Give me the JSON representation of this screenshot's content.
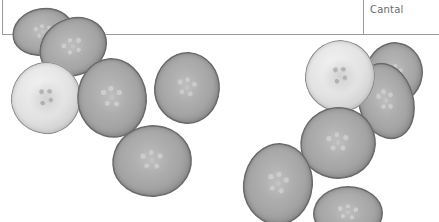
{
  "table_fragment": {
    "cell_text": "Cantal",
    "border_color": "#9a9a9a"
  },
  "photo": {
    "subject": "cucumber slices",
    "tone": "grayscale",
    "slice_count": 12,
    "slices": [
      {
        "id": "left-back-top",
        "x": 12,
        "y": 8,
        "w": 62,
        "h": 48,
        "rot": -10,
        "tone": "mid"
      },
      {
        "id": "left-over-top",
        "x": 38,
        "y": 18,
        "w": 70,
        "h": 58,
        "rot": -25,
        "tone": "mid"
      },
      {
        "id": "left-light",
        "x": 11,
        "y": 62,
        "w": 70,
        "h": 72,
        "rot": 8,
        "tone": "light"
      },
      {
        "id": "left-middle",
        "x": 77,
        "y": 58,
        "w": 70,
        "h": 80,
        "rot": -6,
        "tone": "mid"
      },
      {
        "id": "left-right",
        "x": 154,
        "y": 52,
        "w": 66,
        "h": 72,
        "rot": 4,
        "tone": "mid"
      },
      {
        "id": "left-bottom",
        "x": 112,
        "y": 125,
        "w": 80,
        "h": 72,
        "rot": -5,
        "tone": "mid"
      },
      {
        "id": "right-back",
        "x": 365,
        "y": 42,
        "w": 58,
        "h": 62,
        "rot": 10,
        "tone": "mid"
      },
      {
        "id": "right-overlap",
        "x": 358,
        "y": 62,
        "w": 56,
        "h": 78,
        "rot": -15,
        "tone": "mid"
      },
      {
        "id": "right-light",
        "x": 305,
        "y": 40,
        "w": 70,
        "h": 72,
        "rot": 6,
        "tone": "light"
      },
      {
        "id": "right-center",
        "x": 300,
        "y": 107,
        "w": 76,
        "h": 72,
        "rot": -8,
        "tone": "mid"
      },
      {
        "id": "right-bottom-left",
        "x": 243,
        "y": 143,
        "w": 70,
        "h": 82,
        "rot": 6,
        "tone": "mid"
      },
      {
        "id": "right-bottom",
        "x": 313,
        "y": 186,
        "w": 70,
        "h": 54,
        "rot": 0,
        "tone": "mid"
      }
    ]
  }
}
